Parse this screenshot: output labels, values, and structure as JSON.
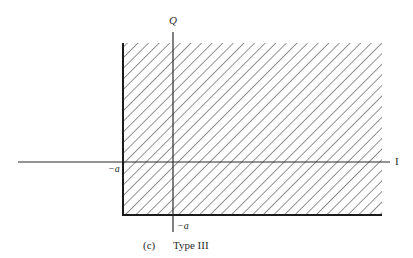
{
  "figure": {
    "caption_tag": "(c)",
    "caption_title": "Type III",
    "axes": {
      "horizontal_label": "I",
      "vertical_label": "Q"
    },
    "region": {
      "fill": "hatched",
      "left_boundary_label": "−a",
      "bottom_boundary_label": "−a",
      "hatch_color": "#3a3a3a",
      "border_color": "#1a1a1a"
    }
  }
}
